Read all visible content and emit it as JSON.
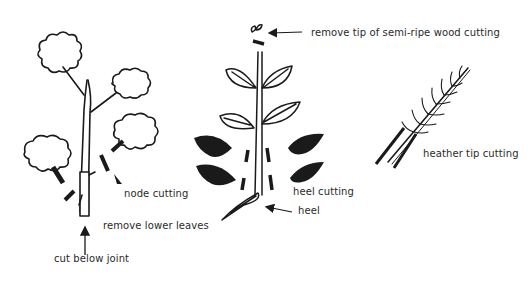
{
  "diagram": {
    "type": "botanical illustration",
    "panels": [
      {
        "name": "node-cutting",
        "labels": {
          "node_cutting": "node cutting",
          "remove_lower_leaves": "remove lower leaves",
          "cut_below_joint": "cut below joint"
        }
      },
      {
        "name": "heel-cutting",
        "labels": {
          "remove_tip": "remove tip of semi-ripe wood cutting",
          "heel_cutting": "heel cutting",
          "heel": "heel"
        }
      },
      {
        "name": "heather-tip-cutting",
        "labels": {
          "heather_tip_cutting": "heather tip cutting"
        }
      }
    ],
    "colors": {
      "ink": "#1a1a1a",
      "background": "#ffffff"
    }
  }
}
